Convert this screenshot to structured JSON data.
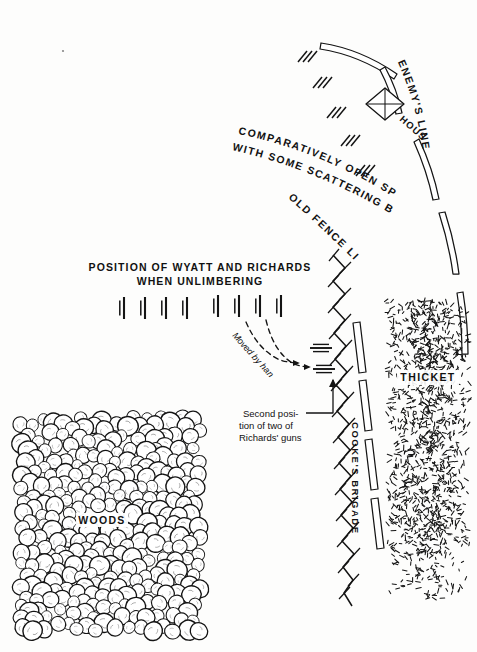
{
  "map": {
    "title": "Civil War battlefield sketch map",
    "width": 477,
    "height": 652,
    "ink_color": "#111111",
    "paper_color": "#fdfdfc"
  },
  "labels": {
    "enemys_line": "ENEMY'S LINE",
    "house": "HOUSE",
    "open_space_line1": "COMPARATIVELY OPEN SPACE",
    "open_space_line2": "WITH SOME SCATTERING BUSHES",
    "old_fence_line": "OLD FENCE LINE",
    "position_line1": "POSITION OF WYATT AND RICHARDS",
    "position_line2": "WHEN UNLIMBERING",
    "moved_by_hand": "Moved by hand",
    "second_position_line1": "Second posi-",
    "second_position_line2": "tion of two of",
    "second_position_line3": "Richards' guns",
    "cookes_brigade": "COOKE'S BRIGADE",
    "thicket": "THICKET",
    "woods": "WOODS"
  },
  "features": {
    "enemy_line_segments": 5,
    "cookes_brigade_bars": 4,
    "gun_symbols_left_group": 4,
    "gun_symbols_right_group": 4,
    "second_position_guns": 2,
    "movement_arrows": 2,
    "brush_hash_marks": 5,
    "house_symbol": "diamond-with-crossed-diagonals"
  }
}
